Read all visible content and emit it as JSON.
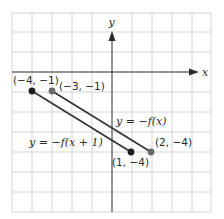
{
  "figure": {
    "x_axis_label": "x",
    "y_axis_label": "y",
    "grid": {
      "x_range": [
        -5,
        5
      ],
      "y_range": [
        -7,
        3
      ],
      "step": 1
    },
    "colors": {
      "grid": "#d4d4d4",
      "axis": "#2a2a2a",
      "line": "#333333",
      "dot_dark": "#1e1e1e",
      "dot_gray": "#6a6a6a"
    }
  },
  "segments": [
    {
      "name": "y = -f(x+1)",
      "label": "y = −f(x + 1)",
      "start": {
        "x": -4,
        "y": -1,
        "label": "(−4, −1)"
      },
      "end": {
        "x": 1,
        "y": -4,
        "label": "(1, −4)"
      }
    },
    {
      "name": "y = -f(x)",
      "label": "y = −f(x)",
      "start": {
        "x": -3,
        "y": -1,
        "label": "(−3, −1)"
      },
      "end": {
        "x": 2,
        "y": -4,
        "label": "(2, −4)"
      }
    }
  ]
}
